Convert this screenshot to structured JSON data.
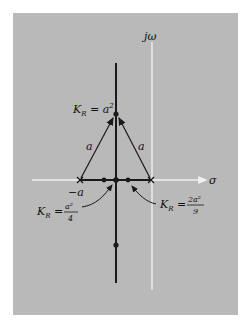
{
  "diagram": {
    "type": "root-locus",
    "axes": {
      "imaginary_label": "jω",
      "real_label": "σ"
    },
    "poles": [
      {
        "label": "−a",
        "position": "-a"
      },
      {
        "label": "",
        "position": "0"
      }
    ],
    "labels": {
      "top_gain": {
        "k": "K",
        "sub": "R",
        "eq": " = a",
        "sup": "2"
      },
      "left_side": "a",
      "right_side": "a",
      "neg_a": "−a",
      "left_gain": {
        "k": "K",
        "sub": "R",
        "eq": " = ",
        "num": "a²",
        "den": "4"
      },
      "right_gain": {
        "k": "K",
        "sub": "R",
        "eq": " = ",
        "num": "2a²",
        "den": "9"
      }
    },
    "colors": {
      "background": "#b9b9b9",
      "axis": "#f2f2f2",
      "locus": "#1a1a1a"
    }
  }
}
